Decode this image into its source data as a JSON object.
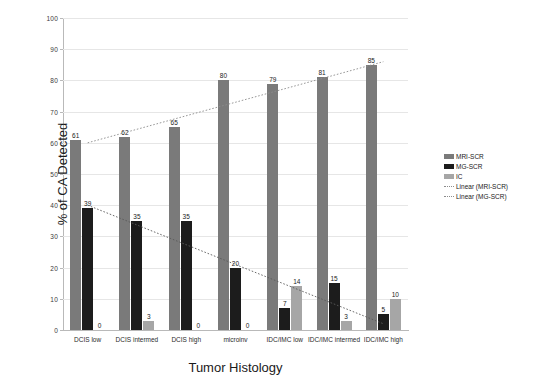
{
  "chart_data": {
    "type": "bar",
    "title": "",
    "xlabel": "Tumor Histology",
    "ylabel": "% of CA Detected",
    "ylim": [
      0,
      100
    ],
    "ytick_step": 10,
    "yticks": [
      "100",
      "90",
      "80",
      "70",
      "60",
      "50",
      "40",
      "30",
      "20",
      "10",
      "0"
    ],
    "grid": "horizontal",
    "legend_position": "right",
    "categories": [
      "DCIS low",
      "DCIS intermed",
      "DCIS high",
      "microinv",
      "IDC/IMC low",
      "IDC/IMC intermed",
      "IDC/IMC high"
    ],
    "series": [
      {
        "name": "MRI-SCR",
        "color": "#7a7a7a",
        "values": [
          61,
          62,
          65,
          80,
          79,
          81,
          85
        ]
      },
      {
        "name": "MG-SCR",
        "color": "#1c1c1c",
        "values": [
          39,
          35,
          35,
          20,
          7,
          15,
          5
        ]
      },
      {
        "name": "IC",
        "color": "#a6a6a6",
        "values": [
          0,
          3,
          0,
          0,
          14,
          3,
          10
        ]
      }
    ],
    "trendlines": [
      {
        "name": "Linear (MRI-SCR)",
        "style": "dotted",
        "color": "#8c8c8c",
        "y_start": 60,
        "y_end": 86
      },
      {
        "name": "Linear (MG-SCR)",
        "style": "dotted",
        "color": "#5a5a5a",
        "y_start": 40,
        "y_end": 2
      }
    ],
    "legend": [
      {
        "label": "MRI-SCR",
        "marker": "swatch",
        "series": 0
      },
      {
        "label": "MG-SCR",
        "marker": "swatch",
        "series": 1
      },
      {
        "label": "IC",
        "marker": "swatch",
        "series": 2
      },
      {
        "label": "Linear (MRI-SCR)",
        "marker": "dotted-line"
      },
      {
        "label": "Linear (MG-SCR)",
        "marker": "dotted-line"
      }
    ]
  }
}
